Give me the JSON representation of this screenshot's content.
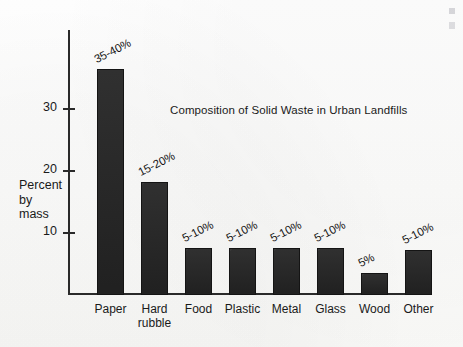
{
  "chart_data": {
    "type": "bar",
    "title": "Composition of Solid Waste in Urban Landfills",
    "xlabel": "",
    "ylabel": "Percent\nby\nmass",
    "ylim": [
      0,
      40
    ],
    "yticks": [
      10,
      20,
      30
    ],
    "ytick_labels": [
      "10",
      "20",
      "30"
    ],
    "grid": false,
    "legend": null,
    "categories": [
      "Paper",
      "Hard\nrubble",
      "Food",
      "Plastic",
      "Metal",
      "Glass",
      "Wood",
      "Other"
    ],
    "values": [
      36.5,
      18.3,
      7.5,
      7.5,
      7.5,
      7.5,
      3.5,
      7.3
    ],
    "data_labels": [
      "35-40%",
      "15-20%",
      "5-10%",
      "5-10%",
      "5-10%",
      "5-10%",
      "5%",
      "5-10%"
    ],
    "bars": [
      {
        "category": "Paper",
        "value": 36.5,
        "label": "35-40%"
      },
      {
        "category": "Hard\nrubble",
        "value": 18.3,
        "label": "15-20%"
      },
      {
        "category": "Food",
        "value": 7.5,
        "label": "5-10%"
      },
      {
        "category": "Plastic",
        "value": 7.5,
        "label": "5-10%"
      },
      {
        "category": "Metal",
        "value": 7.5,
        "label": "5-10%"
      },
      {
        "category": "Glass",
        "value": 7.5,
        "label": "5-10%"
      },
      {
        "category": "Wood",
        "value": 3.5,
        "label": "5%"
      },
      {
        "category": "Other",
        "value": 7.3,
        "label": "5-10%"
      }
    ],
    "colors": {
      "bar_fill": "#252525",
      "bar_stroke": "#141414",
      "axis": "#2a2a2a",
      "text": "#1a1a1a",
      "background": "#fdfdfc"
    }
  }
}
